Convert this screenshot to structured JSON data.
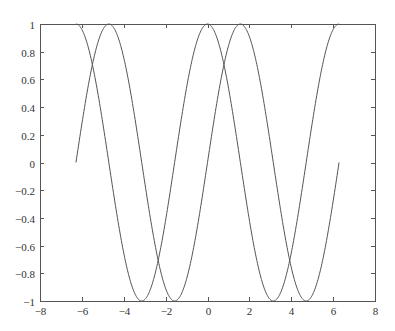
{
  "chart_data": {
    "type": "line",
    "title": "",
    "xlabel": "",
    "ylabel": "",
    "xlim": [
      -8,
      8
    ],
    "ylim": [
      -1,
      1
    ],
    "grid": false,
    "legend": null,
    "x_ticks": [
      -8,
      -6,
      -4,
      -2,
      0,
      2,
      4,
      6,
      8
    ],
    "x_tick_labels": [
      "−8",
      "−6",
      "−4",
      "−2",
      "0",
      "2",
      "4",
      "6",
      "8"
    ],
    "y_ticks": [
      1,
      0.8,
      0.6,
      0.4,
      0.2,
      0,
      -0.2,
      -0.4,
      -0.6,
      -0.8,
      -1
    ],
    "y_tick_labels": [
      "1",
      "0.8",
      "0.6",
      "0.4",
      "0.2",
      "0",
      "−0.2",
      "−0.4",
      "−0.6",
      "−0.8",
      "−1"
    ],
    "x_domain": [
      -6.2832,
      6.2832
    ],
    "series": [
      {
        "name": "sin(x)",
        "function": "sin",
        "color": "#555555",
        "x": [
          -6.28,
          -4.71,
          -3.14,
          -1.57,
          0,
          1.57,
          3.14,
          4.71,
          6.28
        ],
        "values": [
          0,
          1,
          0,
          -1,
          0,
          1,
          0,
          -1,
          0
        ]
      },
      {
        "name": "cos(x)",
        "function": "cos",
        "color": "#555555",
        "x": [
          -6.28,
          -4.71,
          -3.14,
          -1.57,
          0,
          1.57,
          3.14,
          4.71,
          6.28
        ],
        "values": [
          1,
          0,
          -1,
          0,
          1,
          0,
          -1,
          0,
          1
        ]
      }
    ]
  },
  "plot_area": {
    "left": 40,
    "top": 24,
    "right": 375,
    "bottom": 301
  },
  "colors": {
    "axis": "#555555",
    "line": "#555555",
    "text": "#333333",
    "background": "#ffffff"
  }
}
